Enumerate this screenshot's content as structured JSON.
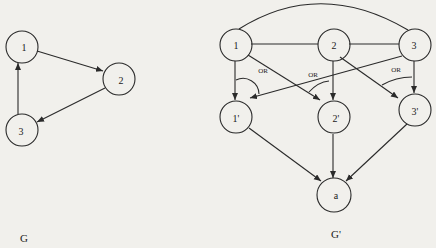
{
  "graph_g": {
    "caption": "G",
    "nodes": [
      {
        "id": "1",
        "label": "1"
      },
      {
        "id": "2",
        "label": "2"
      },
      {
        "id": "3",
        "label": "3"
      }
    ],
    "edges": [
      {
        "from": "1",
        "to": "2",
        "directed": true
      },
      {
        "from": "2",
        "to": "3",
        "directed": true
      },
      {
        "from": "3",
        "to": "1",
        "directed": true
      }
    ]
  },
  "graph_g_prime": {
    "caption": "G'",
    "nodes": [
      {
        "id": "1",
        "label": "1"
      },
      {
        "id": "2",
        "label": "2"
      },
      {
        "id": "3",
        "label": "3"
      },
      {
        "id": "1p",
        "label": "1'"
      },
      {
        "id": "2p",
        "label": "2'"
      },
      {
        "id": "3p",
        "label": "3'"
      },
      {
        "id": "a",
        "label": "a"
      }
    ],
    "or_labels": [
      "OR",
      "OR",
      "OR"
    ],
    "edges": [
      {
        "from": "1",
        "to": "2",
        "directed": false
      },
      {
        "from": "2",
        "to": "3",
        "directed": false
      },
      {
        "from": "1",
        "to": "3",
        "directed": false,
        "curved": true
      },
      {
        "from": "1",
        "to": "1p",
        "directed": true
      },
      {
        "from": "3",
        "to": "1p",
        "directed": true
      },
      {
        "from": "2",
        "to": "2p",
        "directed": true
      },
      {
        "from": "1",
        "to": "2p",
        "directed": true
      },
      {
        "from": "3",
        "to": "3p",
        "directed": true
      },
      {
        "from": "2",
        "to": "3p",
        "directed": true
      },
      {
        "from": "1p",
        "to": "a",
        "directed": true
      },
      {
        "from": "2p",
        "to": "a",
        "directed": true
      },
      {
        "from": "3p",
        "to": "a",
        "directed": true
      }
    ]
  }
}
